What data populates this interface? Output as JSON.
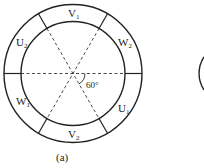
{
  "figure": {
    "caption": "(a)",
    "angle_label": "60°",
    "segments": [
      {
        "id": "V1",
        "base": "V",
        "sub": "1"
      },
      {
        "id": "W2",
        "base": "W",
        "sub": "2"
      },
      {
        "id": "U1",
        "base": "U",
        "sub": "1"
      },
      {
        "id": "V2",
        "base": "V",
        "sub": "2"
      },
      {
        "id": "W1",
        "base": "W",
        "sub": "1"
      },
      {
        "id": "U2",
        "base": "U",
        "sub": "2"
      }
    ],
    "line_color": "#222222",
    "background": "#ffffff"
  }
}
